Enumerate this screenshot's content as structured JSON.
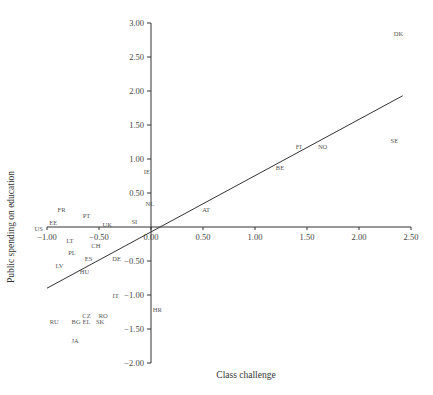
{
  "chart_data": {
    "type": "scatter",
    "title": "",
    "xlabel": "Class challenge",
    "ylabel": "Public spending on education",
    "xlim": [
      -1.0,
      2.5
    ],
    "ylim": [
      -2.0,
      3.0
    ],
    "x_ticks": [
      "-1.00",
      "-0.50",
      "0.00",
      "0.50",
      "1.00",
      "1.50",
      "2.00",
      "2.50"
    ],
    "y_ticks": [
      "-2.00",
      "-1.50",
      "-1.00",
      "-0.50",
      "0.00",
      "0.50",
      "1.00",
      "1.50",
      "2.00",
      "2.50",
      "3.00"
    ],
    "grid": false,
    "legend": null,
    "axes_cross_at_origin": true,
    "points": [
      {
        "label": "DK",
        "x": 2.38,
        "y": 2.84
      },
      {
        "label": "SE",
        "x": 2.34,
        "y": 1.26
      },
      {
        "label": "FI",
        "x": 1.42,
        "y": 1.18
      },
      {
        "label": "NO",
        "x": 1.65,
        "y": 1.18
      },
      {
        "label": "BE",
        "x": 1.24,
        "y": 0.87
      },
      {
        "label": "IE",
        "x": -0.04,
        "y": 0.81
      },
      {
        "label": "NL",
        "x": -0.01,
        "y": 0.34
      },
      {
        "label": "AT",
        "x": 0.53,
        "y": 0.25
      },
      {
        "label": "SI",
        "x": -0.16,
        "y": 0.07
      },
      {
        "label": "UK",
        "x": -0.42,
        "y": 0.03
      },
      {
        "label": "FR",
        "x": -0.86,
        "y": 0.25
      },
      {
        "label": "PT",
        "x": -0.62,
        "y": 0.16
      },
      {
        "label": "EE",
        "x": -0.94,
        "y": 0.06
      },
      {
        "label": "US",
        "x": -1.08,
        "y": -0.03
      },
      {
        "label": "LT",
        "x": -0.78,
        "y": -0.21
      },
      {
        "label": "CH",
        "x": -0.53,
        "y": -0.28
      },
      {
        "label": "PL",
        "x": -0.76,
        "y": -0.38
      },
      {
        "label": "ES",
        "x": -0.6,
        "y": -0.47
      },
      {
        "label": "DE",
        "x": -0.33,
        "y": -0.47
      },
      {
        "label": "LV",
        "x": -0.88,
        "y": -0.57
      },
      {
        "label": "HU",
        "x": -0.64,
        "y": -0.66
      },
      {
        "label": "IT",
        "x": -0.34,
        "y": -1.01
      },
      {
        "label": "HR",
        "x": 0.06,
        "y": -1.22
      },
      {
        "label": "CZ",
        "x": -0.62,
        "y": -1.31
      },
      {
        "label": "RO",
        "x": -0.46,
        "y": -1.31
      },
      {
        "label": "RU",
        "x": -0.93,
        "y": -1.4
      },
      {
        "label": "BG",
        "x": -0.72,
        "y": -1.4
      },
      {
        "label": "EL",
        "x": -0.62,
        "y": -1.4
      },
      {
        "label": "SK",
        "x": -0.49,
        "y": -1.4
      },
      {
        "label": "JA",
        "x": -0.73,
        "y": -1.68
      }
    ],
    "regression_line": {
      "x1": -1.0,
      "y1": -0.9,
      "x2": 2.42,
      "y2": 1.93
    }
  },
  "colors": {
    "axis": "#333333",
    "line": "#333333",
    "text": "#444444"
  }
}
